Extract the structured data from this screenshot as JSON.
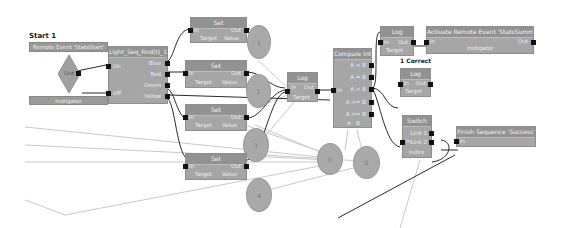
{
  "graph": {
    "start": {
      "caption": "Start 1",
      "event_title": "Remote Event 'StatsStart'",
      "diamond_pin": "Out",
      "bottom_bar": "Instigator"
    },
    "switch_node": {
      "title": "Light_Seq_Rnd(t)_1",
      "inputs": [
        "On",
        "Off"
      ],
      "outputs": [
        "Blue",
        "Red",
        "Green",
        "Yellow"
      ]
    },
    "set_nodes": [
      {
        "title": "Set",
        "in": "In",
        "out": "Out",
        "bottom": [
          "Target",
          "Value"
        ],
        "value_circle": "1"
      },
      {
        "title": "Set",
        "in": "In",
        "out": "Out",
        "bottom": [
          "Target",
          "Value"
        ],
        "value_circle": "2"
      },
      {
        "title": "Set",
        "in": "In",
        "out": "Out",
        "bottom": [
          "Target",
          "Value"
        ],
        "value_circle": "3"
      },
      {
        "title": "Set",
        "in": "In",
        "out": "Out",
        "bottom": [
          "Target",
          "Value"
        ],
        "value_circle": "4"
      }
    ],
    "middle_log": {
      "title": "Log",
      "in": "In",
      "out": "Out",
      "bottom": "Target"
    },
    "compare": {
      "title": "Compare Int",
      "input": "In",
      "outputs": [
        "A < B",
        "A = B",
        "A > B",
        "A <= B",
        "A >= B"
      ],
      "bottom": [
        "A",
        "B"
      ]
    },
    "var_circles": [
      "0",
      "0"
    ],
    "top_log": {
      "title": "Log",
      "in": "In",
      "out": "Out",
      "bottom": "Target"
    },
    "activate_event": {
      "title": "Activate Remote Event 'StatsSummary'",
      "in": "In",
      "out": "Out",
      "bottom": "Instigator"
    },
    "correct_caption": "1 Correct",
    "correct_log": {
      "title": "Log",
      "in": "In",
      "out": "Out",
      "bottom": "Target"
    },
    "gate": {
      "title": "Switch",
      "in": "In",
      "outputs": [
        "Link 1",
        "Link 2"
      ],
      "bottom": "Index"
    },
    "finish_event": {
      "title": "Finish Sequence 'Success'",
      "in": "In"
    }
  },
  "colors": {
    "node_body": "#a6a6a6",
    "node_title": "#929292",
    "pin": "#111111",
    "wire_exec": "#222222",
    "wire_var": "#c8c8c8",
    "background": "#ffffff"
  }
}
